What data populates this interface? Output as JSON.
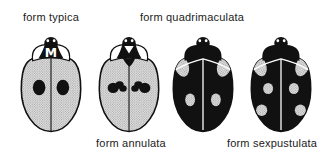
{
  "colors": {
    "ink": "#111111",
    "stipple_base": "#e7e7e7",
    "stipple_dot": "#909090",
    "mark_white": "#ffffff",
    "background": "#ffffff"
  },
  "forms": [
    {
      "label": "form typica",
      "label_position": "top",
      "elytra": "light stippled",
      "pattern": "one round black spot on each elytron (2 spots total)",
      "pronotum_mark": "M"
    },
    {
      "label": "form quadrimaculata",
      "label_position": "top",
      "elytra": "black",
      "pattern": "4 light markings: 2 shoulder patches and 2 oval spots"
    },
    {
      "label": "form annulata",
      "label_position": "bottom",
      "elytra": "light stippled",
      "pattern": "irregular black blotch band on each elytron, black scutellar triangle"
    },
    {
      "label": "form sexpustulata",
      "label_position": "bottom",
      "elytra": "black",
      "pattern": "6 light markings: 2 shoulder patches, 2 mid spots, 2 rear spots"
    }
  ]
}
